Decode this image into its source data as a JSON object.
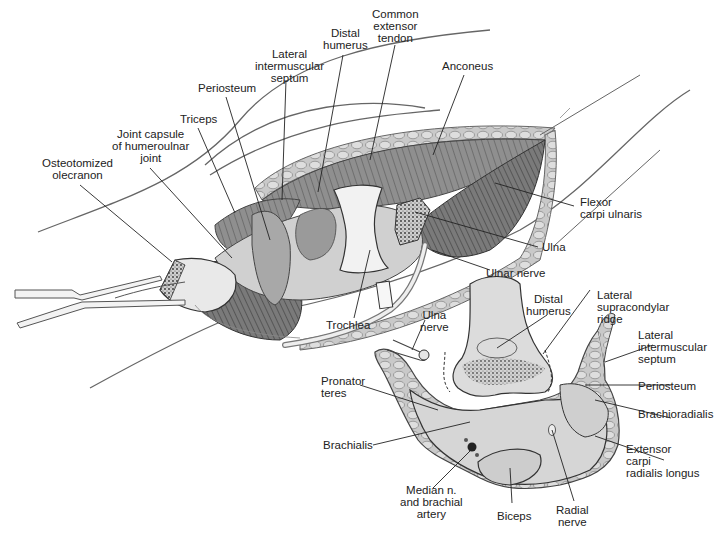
{
  "figure": {
    "colors": {
      "background": "#ffffff",
      "ink": "#222222",
      "muscle": "#8a8a8a",
      "muscle_dark": "#4a4a4a",
      "bone": "#e4e4e4",
      "section_fill": "#d6d6d6",
      "skin_line": "#555555"
    }
  },
  "upper_illustration": {
    "name": "Surgical exposure of elbow joint",
    "labels": [
      {
        "id": "osteotomized-olecranon",
        "text": "Osteotomized\nolecranon"
      },
      {
        "id": "joint-capsule",
        "text": "Joint capsule\nof humeroulnar\njoint"
      },
      {
        "id": "triceps",
        "text": "Triceps"
      },
      {
        "id": "periosteum-top",
        "text": "Periosteum"
      },
      {
        "id": "lateral-intermuscular-septum-top",
        "text": "Lateral\nintermuscular\nseptum"
      },
      {
        "id": "distal-humerus-top",
        "text": "Distal\nhumerus"
      },
      {
        "id": "common-extensor-tendon",
        "text": "Common\nextensor\ntendon"
      },
      {
        "id": "anconeus",
        "text": "Anconeus"
      },
      {
        "id": "flexor-carpi-ulnaris",
        "text": "Flexor\ncarpi ulnaris"
      },
      {
        "id": "ulna",
        "text": "Ulna"
      },
      {
        "id": "ulnar-nerve",
        "text": "Ulnar nerve"
      },
      {
        "id": "trochlea",
        "text": "Trochlea"
      }
    ]
  },
  "cross_section": {
    "name": "Cross-section of distal arm",
    "labels": [
      {
        "id": "ulna-nerve",
        "text": "Ulna\nnerve"
      },
      {
        "id": "distal-humerus-section",
        "text": "Distal\nhumerus"
      },
      {
        "id": "lateral-supracondylar-ridge",
        "text": "Lateral\nsupracondylar\nridge"
      },
      {
        "id": "lateral-intermuscular-septum-section",
        "text": "Lateral\nintermuscular\nseptum"
      },
      {
        "id": "pronator-teres",
        "text": "Pronator\nteres"
      },
      {
        "id": "periosteum-section",
        "text": "Periosteum"
      },
      {
        "id": "brachioradialis",
        "text": "Brachioradialis"
      },
      {
        "id": "brachialis",
        "text": "Brachialis"
      },
      {
        "id": "extensor-carpi-radialis-longus",
        "text": "Extensor\ncarpi\nradialis longus"
      },
      {
        "id": "median-nerve-brachial-artery",
        "text": "Median n.\nand brachial\nartery"
      },
      {
        "id": "biceps",
        "text": "Biceps"
      },
      {
        "id": "radial-nerve",
        "text": "Radial\nnerve"
      }
    ]
  }
}
